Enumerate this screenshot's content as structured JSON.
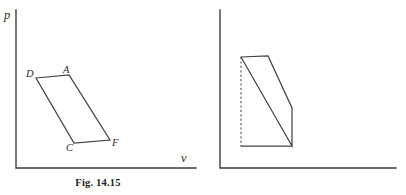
{
  "page": {
    "background_color": "#ffffff",
    "ink_color": "#3d3d3d",
    "width": 406,
    "height": 195
  },
  "figures": [
    {
      "id": "fig-14-15",
      "caption": "Fig. 14.15",
      "axes": {
        "y_label": "p",
        "x_label": "v",
        "origin": [
          16,
          168
        ],
        "y_top": [
          16,
          10
        ],
        "x_right": [
          196,
          168
        ]
      },
      "vertices": [
        {
          "name": "D",
          "label": "D",
          "point": [
            36,
            78
          ]
        },
        {
          "name": "A",
          "label": "A",
          "point": [
            69,
            75
          ]
        },
        {
          "name": "F",
          "label": "F",
          "point": [
            110,
            140
          ]
        },
        {
          "name": "C",
          "label": "C",
          "point": [
            74,
            143
          ]
        }
      ],
      "cycle_path": "M 36,78 L 69,75 L 110,140 L 74,143 Z",
      "dashed_paths": []
    },
    {
      "id": "fig-14-16",
      "caption": "Fig. 14.16",
      "axes": {
        "y_label": "p",
        "x_label": "v",
        "origin": [
          220,
          168
        ],
        "y_top": [
          220,
          10
        ],
        "x_right": [
          396,
          168
        ]
      },
      "vertices": [
        {
          "name": "D",
          "label": "D",
          "point": [
            241,
            57
          ]
        },
        {
          "name": "A",
          "label": "A",
          "point": [
            268,
            56
          ]
        },
        {
          "name": "B",
          "label": "B",
          "point": [
            292,
            108
          ]
        },
        {
          "name": "C",
          "label": "C",
          "point": [
            292,
            146
          ]
        },
        {
          "name": "E",
          "label": "E",
          "point": [
            241,
            146
          ]
        }
      ],
      "cycle_path": "M 241,57 L 268,56 L 292,108 L 292,146 L 241,57 M 292,146 L 241,146",
      "dashed_paths": [
        "M 241,57 L 241,146"
      ]
    }
  ],
  "chart_data": {
    "type": "line",
    "xlabel": "v",
    "ylabel": "p",
    "grid": false,
    "legend": "none",
    "panels": [
      {
        "name": "Fig. 14.15",
        "description": "Closed parallelogram cycle D-A-F-C in the p-v plane; D-A is the upper side, C-F the lower side, and D-C / A-F the slanted sides.",
        "points": [
          {
            "label": "D",
            "x": 36,
            "y": 78
          },
          {
            "label": "A",
            "x": 69,
            "y": 75
          },
          {
            "label": "F",
            "x": 110,
            "y": 140
          },
          {
            "label": "C",
            "x": 74,
            "y": 143
          }
        ],
        "edges": [
          "D-A",
          "A-F",
          "F-C",
          "C-D"
        ]
      },
      {
        "name": "Fig. 14.16",
        "description": "Closed cycle D-A-B-C-D with vertical side B-C, horizontal side E-C, and dashed vertical construction line from D down to E on the volume axis.",
        "points": [
          {
            "label": "D",
            "x": 241,
            "y": 57
          },
          {
            "label": "A",
            "x": 268,
            "y": 56
          },
          {
            "label": "B",
            "x": 292,
            "y": 108
          },
          {
            "label": "C",
            "x": 292,
            "y": 146
          },
          {
            "label": "E",
            "x": 241,
            "y": 146
          }
        ],
        "edges": [
          "D-A",
          "A-B",
          "B-C",
          "C-D",
          "C-E"
        ],
        "dashed_edges": [
          "D-E"
        ]
      }
    ]
  }
}
